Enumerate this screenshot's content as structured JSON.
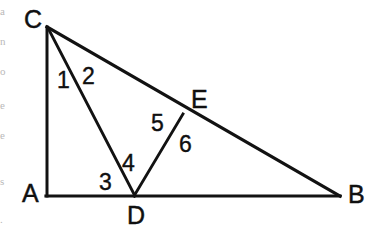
{
  "figure": {
    "background_color": "#ffffff",
    "ink_color": "#121212",
    "width": 378,
    "height": 251,
    "vertices": [
      {
        "id": "C",
        "label": "C",
        "x": 47,
        "y": 27,
        "label_x": 24,
        "label_y": 28,
        "anchor": "start"
      },
      {
        "id": "A",
        "label": "A",
        "x": 47,
        "y": 196,
        "label_x": 22,
        "label_y": 202,
        "anchor": "start"
      },
      {
        "id": "B",
        "label": "B",
        "x": 339,
        "y": 196,
        "label_x": 348,
        "label_y": 203,
        "anchor": "start"
      },
      {
        "id": "D",
        "label": "D",
        "x": 134,
        "y": 196,
        "label_x": 127,
        "label_y": 224,
        "anchor": "start"
      },
      {
        "id": "E",
        "label": "E",
        "x": 182,
        "y": 115,
        "label_x": 191,
        "label_y": 108,
        "anchor": "start"
      }
    ],
    "edges": [
      {
        "id": "CA",
        "from": "C",
        "to": "A",
        "x1": 47,
        "y1": 27,
        "x2": 47,
        "y2": 196,
        "width": 3.0
      },
      {
        "id": "AB",
        "from": "A",
        "to": "B",
        "x1": 46,
        "y1": 196,
        "x2": 340,
        "y2": 196,
        "width": 3.2
      },
      {
        "id": "CB",
        "from": "C",
        "to": "B",
        "x1": 47,
        "y1": 27,
        "x2": 340,
        "y2": 196,
        "width": 3.2
      },
      {
        "id": "CD",
        "from": "C",
        "to": "D",
        "x1": 48,
        "y1": 28,
        "x2": 135,
        "y2": 196,
        "width": 2.8
      },
      {
        "id": "DE",
        "from": "D",
        "to": "E",
        "x1": 134,
        "y1": 196,
        "x2": 183,
        "y2": 114,
        "width": 2.8
      }
    ],
    "angle_labels": [
      {
        "id": "1",
        "label": "1",
        "x": 57,
        "y": 88,
        "at_vertex": "C"
      },
      {
        "id": "2",
        "label": "2",
        "x": 82,
        "y": 84,
        "at_vertex": "C"
      },
      {
        "id": "3",
        "label": "3",
        "x": 99,
        "y": 190,
        "at_vertex": "D"
      },
      {
        "id": "4",
        "label": "4",
        "x": 122,
        "y": 171,
        "at_vertex": "D"
      },
      {
        "id": "5",
        "label": "5",
        "x": 151,
        "y": 131,
        "at_vertex": "E"
      },
      {
        "id": "6",
        "label": "6",
        "x": 179,
        "y": 152,
        "at_vertex": "E"
      }
    ],
    "margin_fragments": [
      {
        "text": "a",
        "y": 6
      },
      {
        "text": "n",
        "y": 36
      },
      {
        "text": "o",
        "y": 66
      },
      {
        "text": "e",
        "y": 100
      },
      {
        "text": "e",
        "y": 130
      },
      {
        "text": "s",
        "y": 176
      },
      {
        "text": ".",
        "y": 214
      }
    ]
  }
}
